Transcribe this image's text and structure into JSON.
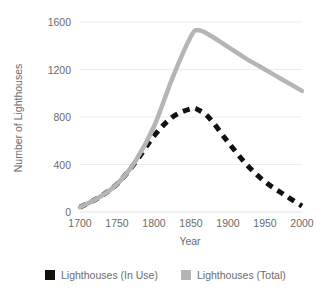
{
  "chart_data": {
    "type": "line",
    "title": "",
    "xlabel": "Year",
    "ylabel": "Number of Lighthouses",
    "xlim": [
      1700,
      2000
    ],
    "ylim": [
      0,
      1600
    ],
    "xticks": [
      1700,
      1750,
      1800,
      1850,
      1900,
      1950,
      2000
    ],
    "yticks": [
      0,
      400,
      800,
      1200,
      1600
    ],
    "grid": true,
    "legend_position": "bottom",
    "x": [
      1700,
      1725,
      1750,
      1775,
      1800,
      1825,
      1850,
      1860,
      1875,
      1900,
      1925,
      1950,
      1975,
      2000
    ],
    "series": [
      {
        "name": "Lighthouses (In Use)",
        "color": "#111111",
        "style": "dashed",
        "values": [
          40,
          120,
          235,
          420,
          640,
          800,
          870,
          860,
          790,
          590,
          400,
          255,
          150,
          50
        ]
      },
      {
        "name": "Lighthouses (Total)",
        "color": "#b5b5b5",
        "style": "solid",
        "values": [
          40,
          120,
          235,
          430,
          720,
          1130,
          1480,
          1530,
          1490,
          1390,
          1290,
          1200,
          1110,
          1020
        ]
      }
    ]
  },
  "legend": {
    "items": [
      {
        "label": "Lighthouses (In Use)",
        "swatch": "#111111"
      },
      {
        "label": "Lighthouses (Total)",
        "swatch": "#b5b5b5"
      }
    ]
  },
  "axes": {
    "y_title": "Number of Lighthouses",
    "x_title": "Year",
    "y_tick_labels": [
      "0",
      "400",
      "800",
      "1200",
      "1600"
    ],
    "x_tick_labels": [
      "1700",
      "1750",
      "1800",
      "1850",
      "1900",
      "1950",
      "2000"
    ]
  }
}
